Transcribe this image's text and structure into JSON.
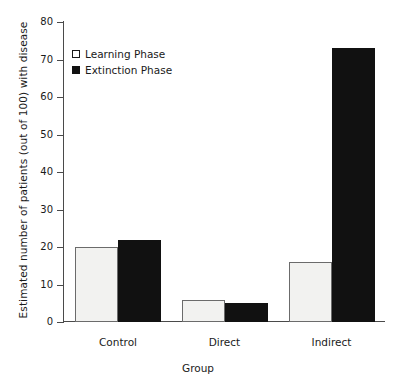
{
  "chart_data": {
    "type": "bar",
    "title": "",
    "xlabel": "Group",
    "ylabel": "Estimated number of patients (out of 100) with disease",
    "categories": [
      "Control",
      "Direct",
      "Indirect"
    ],
    "series": [
      {
        "name": "Learning Phase",
        "values": [
          20,
          6,
          16
        ],
        "color": "#f2f2f0",
        "marker": "open-square"
      },
      {
        "name": "Extinction Phase",
        "values": [
          22,
          5,
          73
        ],
        "color": "#111111",
        "marker": "filled-square"
      }
    ],
    "ylim": [
      0,
      80
    ],
    "yticks": [
      0,
      10,
      20,
      30,
      40,
      50,
      60,
      70,
      80
    ],
    "ytick_labels": [
      "0",
      "10",
      "20",
      "30",
      "40",
      "50",
      "60",
      "70",
      "80"
    ],
    "grid": false,
    "legend_position": "upper-left-inside"
  }
}
